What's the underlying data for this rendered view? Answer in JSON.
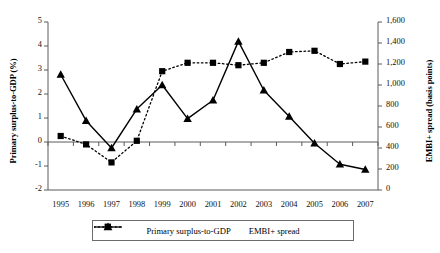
{
  "chart_data": {
    "type": "line",
    "title": "",
    "xlabel": "",
    "categories": [
      "1995",
      "1996",
      "1997",
      "1998",
      "1999",
      "2000",
      "2001",
      "2002",
      "2003",
      "2004",
      "2005",
      "2006",
      "2007"
    ],
    "grid": false,
    "legend_position": "bottom",
    "axes": {
      "left": {
        "label": "Primary surplus-to-GDP (%)",
        "ticks": [
          "5",
          "4",
          "3",
          "2",
          "1",
          "0",
          "-1",
          "-2"
        ],
        "tick_values": [
          5,
          4,
          3,
          2,
          1,
          0,
          -1,
          -2
        ],
        "ylim": [
          -2,
          5
        ]
      },
      "right": {
        "label": "EMBI+ spread (basis points)",
        "ticks": [
          "1,600",
          "1,400",
          "1,200",
          "1,000",
          "800",
          "600",
          "400",
          "200",
          "0"
        ],
        "tick_values": [
          1600,
          1400,
          1200,
          1000,
          800,
          600,
          400,
          200,
          0
        ],
        "ylim": [
          0,
          1600
        ]
      }
    },
    "series": [
      {
        "name": "Primary surplus-to-GDP",
        "axis": "left",
        "marker": "square",
        "line_style": "dotted",
        "color": "#000000",
        "values": [
          0.25,
          -0.1,
          -0.85,
          0.05,
          2.95,
          3.3,
          3.3,
          3.2,
          3.3,
          3.75,
          3.8,
          3.25,
          3.35
        ]
      },
      {
        "name": "EMBI+ spread",
        "axis": "right",
        "marker": "triangle",
        "line_style": "solid",
        "color": "#000000",
        "values": [
          1100,
          660,
          400,
          770,
          1000,
          680,
          855,
          1415,
          950,
          700,
          445,
          245,
          195
        ]
      }
    ]
  },
  "legend": {
    "items": [
      {
        "label": "Primary surplus-to-GDP",
        "marker": "square",
        "style": "dotted"
      },
      {
        "label": "EMBI+ spread",
        "marker": "triangle",
        "style": "solid"
      }
    ]
  }
}
